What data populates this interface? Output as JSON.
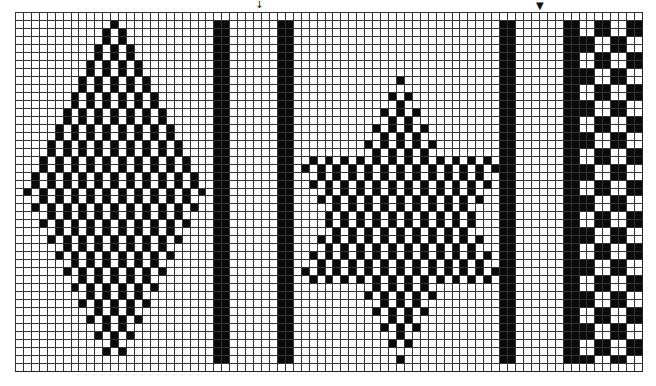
{
  "figure": {
    "type": "weaving-draft-grid",
    "grid": {
      "cols": 79,
      "rows": 45,
      "line_color": "#333333",
      "fill_color": "#0a0a0a",
      "background": "#ffffff"
    },
    "markers": [
      {
        "name": "arrow-marker-1",
        "glyph": "↓",
        "x": 255,
        "y": 0
      },
      {
        "name": "arrow-marker-2",
        "glyph": "▼",
        "x": 536,
        "y": 1
      }
    ],
    "motifs": [
      {
        "name": "diamond-motif",
        "kind": "diamond",
        "center_col": 12,
        "top_row": 1,
        "mid_row": 22,
        "bottom_row": 43,
        "half_width": 11,
        "pattern": "brick-1x2"
      },
      {
        "name": "bar-1",
        "kind": "bar",
        "col": 25,
        "width": 2,
        "top_row": 1,
        "bottom_row": 43
      },
      {
        "name": "bar-2",
        "kind": "bar",
        "col": 33,
        "width": 2,
        "top_row": 1,
        "bottom_row": 43
      },
      {
        "name": "star-motif",
        "kind": "star",
        "center_col": 48,
        "top_row": 8,
        "upper_wide_row": 18,
        "lower_wide_row": 33,
        "bottom_row": 43,
        "half_width": 12,
        "pattern": "brick-1x2"
      },
      {
        "name": "bar-3",
        "kind": "bar",
        "col": 61,
        "width": 2,
        "top_row": 1,
        "bottom_row": 43
      },
      {
        "name": "bar-4",
        "kind": "bar",
        "col": 69,
        "width": 2,
        "top_row": 1,
        "bottom_row": 43
      },
      {
        "name": "checker-block",
        "kind": "checker",
        "col": 71,
        "width": 8,
        "top_row": 1,
        "bottom_row": 43,
        "block": 2
      }
    ]
  }
}
